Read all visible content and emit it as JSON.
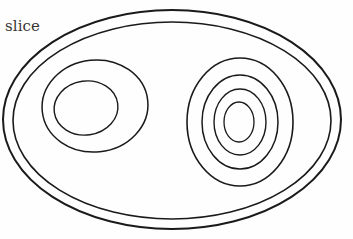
{
  "canvas": {
    "width": 353,
    "height": 239,
    "background_color": "#fefefe",
    "stroke_color": "#1a1a1a",
    "title": "slice"
  },
  "annotations": [
    {
      "name": "slice-label",
      "text": "slice",
      "x": 5,
      "y": 19,
      "font_size": 15,
      "color": "#3a3634"
    }
  ],
  "shapes": {
    "outer_rim": {
      "name": "outer-boundary",
      "description": "double-line outer ellipse forming the slice outline",
      "ellipses": [
        {
          "cx": 172,
          "cy": 119.5,
          "rx": 169,
          "ry": 109.5,
          "stroke_width": 2.0
        },
        {
          "cx": 172,
          "cy": 120.5,
          "rx": 159,
          "ry": 98.5,
          "stroke_width": 1.6
        }
      ]
    },
    "left_group": {
      "name": "left-concentric-group",
      "description": "two concentric ellipses on the left side",
      "ellipses": [
        {
          "cx": 95,
          "cy": 106,
          "rx": 53,
          "ry": 46,
          "stroke_width": 1.5
        },
        {
          "cx": 86,
          "cy": 108,
          "rx": 32,
          "ry": 27,
          "stroke_width": 1.4
        }
      ]
    },
    "right_group": {
      "name": "right-concentric-group",
      "description": "four concentric ellipses on the right side",
      "ellipses": [
        {
          "cx": 240,
          "cy": 122,
          "rx": 53,
          "ry": 64,
          "stroke_width": 1.6
        },
        {
          "cx": 240,
          "cy": 122,
          "rx": 38,
          "ry": 47,
          "stroke_width": 1.5
        },
        {
          "cx": 240,
          "cy": 122,
          "rx": 26,
          "ry": 33,
          "stroke_width": 1.4
        },
        {
          "cx": 239,
          "cy": 122,
          "rx": 15,
          "ry": 20,
          "stroke_width": 1.3
        }
      ]
    }
  },
  "counts": {
    "outer_rim_lines": 2,
    "left_rings": 2,
    "right_rings": 4,
    "total_ellipses": 8
  }
}
